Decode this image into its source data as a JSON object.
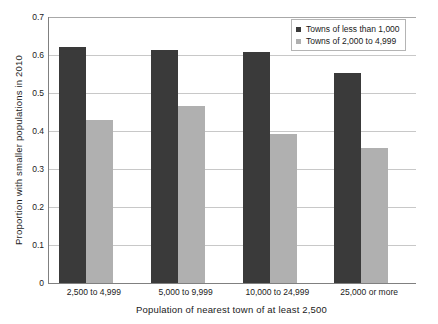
{
  "chart_data": {
    "type": "bar",
    "title": "",
    "subtitle": "",
    "xlabel": "Population of nearest town of at least 2,500",
    "ylabel": "Proportion with smaller populations in 2010",
    "categories": [
      "2,500 to 4,999",
      "5,000 to 9,999",
      "10,000 to 24,999",
      "25,000 or more"
    ],
    "series": [
      {
        "name": "Towns of less than 1,000",
        "color": "#3a3a3a",
        "values": [
          0.62,
          0.613,
          0.608,
          0.553
        ]
      },
      {
        "name": "Towns of 2,000 to 4,999",
        "color": "#b0b0b0",
        "values": [
          0.428,
          0.465,
          0.392,
          0.355
        ]
      }
    ],
    "ylim": [
      0,
      0.7
    ],
    "ytick_values": [
      0,
      0.1,
      0.2,
      0.3,
      0.4,
      0.5,
      0.6,
      0.7
    ],
    "ytick_labels": [
      "0",
      "0.1",
      "0.2",
      "0.3",
      "0.4",
      "0.5",
      "0.6",
      "0.7"
    ],
    "grid": true,
    "grid_axis": "y",
    "legend_position": "top-right",
    "bar_layout": "grouped",
    "background_color": "#ffffff",
    "gridline_color": "#c8c8c8",
    "axis_color": "#808080"
  }
}
